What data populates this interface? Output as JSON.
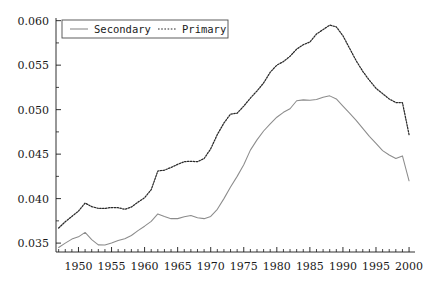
{
  "chart_data": {
    "type": "line",
    "title": "",
    "xlabel": "",
    "ylabel": "",
    "xlim": [
      1946.6,
      2000.9
    ],
    "ylim": [
      0.034,
      0.0603
    ],
    "grid": false,
    "legend_position": "top-left",
    "yticks": [
      "0.035",
      "0.040",
      "0.045",
      "0.050",
      "0.055",
      "0.060"
    ],
    "ytick_values": [
      0.035,
      0.04,
      0.045,
      0.05,
      0.055,
      0.06
    ],
    "xticks": [
      "1950",
      "1955",
      "1960",
      "1965",
      "1970",
      "1975",
      "1980",
      "1985",
      "1990",
      "1995",
      "2000"
    ],
    "xtick_values": [
      1950,
      1955,
      1960,
      1965,
      1970,
      1975,
      1980,
      1985,
      1990,
      1995,
      2000
    ],
    "minor_xtick_step": 1,
    "x": [
      1947,
      1948,
      1949,
      1950,
      1951,
      1952,
      1953,
      1954,
      1955,
      1956,
      1957,
      1958,
      1959,
      1960,
      1961,
      1962,
      1963,
      1964,
      1965,
      1966,
      1967,
      1968,
      1969,
      1970,
      1971,
      1972,
      1973,
      1974,
      1975,
      1976,
      1977,
      1978,
      1979,
      1980,
      1981,
      1982,
      1983,
      1984,
      1985,
      1986,
      1987,
      1988,
      1989,
      1990,
      1991,
      1992,
      1993,
      1994,
      1995,
      1996,
      1997,
      1998,
      1999,
      2000
    ],
    "series": [
      {
        "name": "Secondary",
        "style": "solid",
        "color": "#8c8c8c",
        "values": [
          0.0345,
          0.035,
          0.03545,
          0.0357,
          0.0362,
          0.0354,
          0.0348,
          0.03478,
          0.035,
          0.03528,
          0.03548,
          0.03585,
          0.0364,
          0.0369,
          0.03745,
          0.03828,
          0.038,
          0.03775,
          0.03775,
          0.03795,
          0.0381,
          0.03785,
          0.03775,
          0.038,
          0.0388,
          0.04,
          0.0413,
          0.0425,
          0.0438,
          0.04545,
          0.0466,
          0.0476,
          0.0484,
          0.04915,
          0.0497,
          0.0501,
          0.051,
          0.0511,
          0.05105,
          0.05115,
          0.0514,
          0.05155,
          0.0512,
          0.0504,
          0.0496,
          0.0488,
          0.0479,
          0.047,
          0.0462,
          0.0454,
          0.0449,
          0.0445,
          0.0448,
          0.042
        ]
      },
      {
        "name": "Primary",
        "style": "dotted",
        "color": "#2a2a2a",
        "values": [
          0.0367,
          0.0374,
          0.038,
          0.0386,
          0.0395,
          0.0391,
          0.0389,
          0.0389,
          0.039,
          0.03898,
          0.0388,
          0.03905,
          0.0396,
          0.0401,
          0.041,
          0.0431,
          0.0432,
          0.0435,
          0.04385,
          0.04415,
          0.0442,
          0.04415,
          0.0445,
          0.0456,
          0.0472,
          0.0485,
          0.0495,
          0.0496,
          0.0504,
          0.0513,
          0.0521,
          0.053,
          0.0542,
          0.055,
          0.0554,
          0.056,
          0.0568,
          0.0573,
          0.0576,
          0.0585,
          0.059,
          0.0595,
          0.0593,
          0.0583,
          0.0569,
          0.0555,
          0.0543,
          0.0533,
          0.0524,
          0.0518,
          0.0512,
          0.0508,
          0.0508,
          0.0472
        ]
      }
    ]
  },
  "legend": {
    "entries": [
      {
        "label": "Secondary",
        "marker": "solid-line"
      },
      {
        "label": "Primary",
        "marker": "dotted-line"
      }
    ]
  }
}
